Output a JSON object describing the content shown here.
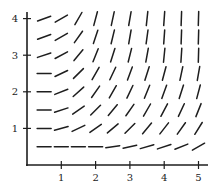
{
  "figure": {
    "type": "slope-field",
    "x_ticks": [
      "1",
      "2",
      "3",
      "4",
      "5"
    ],
    "y_ticks": [
      "1",
      "2",
      "3",
      "4"
    ],
    "colors": {
      "ink": "#1e1e1e",
      "background": "#ffffff"
    }
  },
  "chart_data": {
    "type": "slope_field",
    "title": "",
    "xlabel": "",
    "ylabel": "",
    "xlim": [
      0,
      5.2
    ],
    "ylim": [
      0,
      4.2
    ],
    "x_ticks": [
      1,
      2,
      3,
      4,
      5
    ],
    "y_ticks": [
      1,
      2,
      3,
      4
    ],
    "grid_x": [
      0.5,
      1,
      1.5,
      2,
      2.5,
      3,
      3.5,
      4,
      4.5,
      5
    ],
    "grid_y": [
      0.5,
      1,
      1.5,
      2,
      2.5,
      3,
      3.5,
      4
    ],
    "segment_angles_deg_by_row": {
      "4": [
        20,
        30,
        60,
        75,
        78,
        80,
        84,
        86,
        88,
        88
      ],
      "3.5": [
        20,
        30,
        55,
        72,
        76,
        80,
        82,
        86,
        88,
        88
      ],
      "3": [
        18,
        28,
        50,
        68,
        72,
        76,
        80,
        84,
        86,
        88
      ],
      "2.5": [
        0,
        25,
        45,
        60,
        65,
        70,
        72,
        75,
        78,
        80
      ],
      "2": [
        0,
        22,
        42,
        55,
        60,
        65,
        68,
        70,
        72,
        75
      ],
      "1.5": [
        0,
        18,
        35,
        45,
        50,
        55,
        60,
        62,
        65,
        68
      ],
      "1": [
        0,
        15,
        25,
        35,
        40,
        45,
        50,
        52,
        55,
        58
      ],
      "0.5": [
        0,
        0,
        0,
        0,
        8,
        12,
        16,
        18,
        22,
        30
      ]
    }
  }
}
